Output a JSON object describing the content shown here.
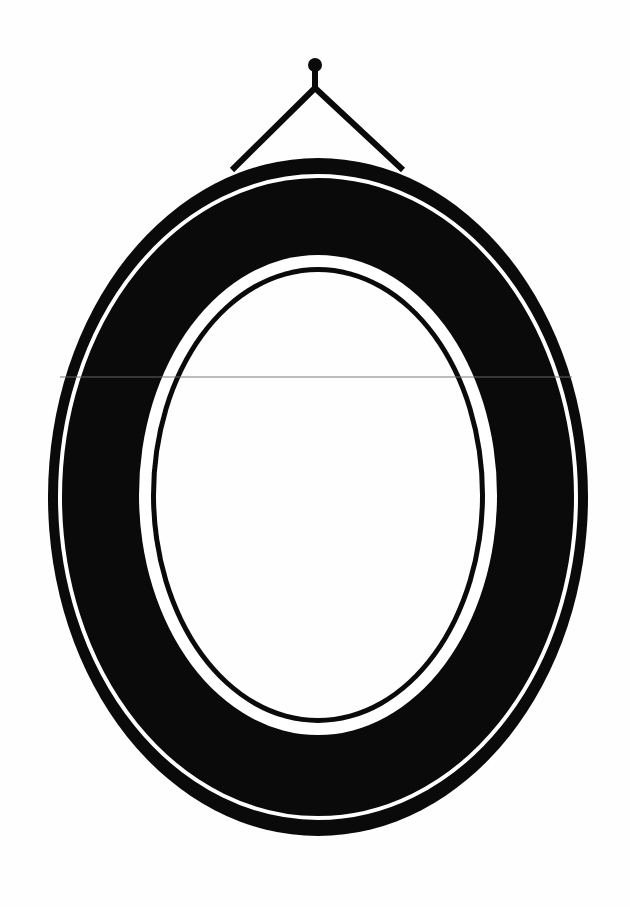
{
  "illustration": {
    "title": "Oval picture frame hanging on a nail",
    "colors": {
      "background": "#fefefe",
      "ink": "#0a0a0a",
      "scanline": "#6e6e6e"
    },
    "nail": {
      "cx": 315,
      "cy": 65,
      "r": 7,
      "stem_bottom_y": 90
    },
    "wire": {
      "apex": [
        315,
        88
      ],
      "left_end": [
        232,
        170
      ],
      "right_end": [
        403,
        170
      ],
      "stroke_width": 6
    },
    "frame": {
      "center": [
        318,
        497
      ],
      "outer": {
        "rx": 270,
        "ry": 339
      },
      "outer_white_line": {
        "rx": 258,
        "ry": 321,
        "width": 4
      },
      "inner_white_ring": {
        "rx": 179,
        "ry": 240
      },
      "inner_black_line": {
        "rx": 167,
        "ry": 228,
        "width": 5
      },
      "opening": {
        "rx": 162,
        "ry": 223
      }
    },
    "scanline": {
      "y": 377,
      "x1": 60,
      "x2": 572
    }
  }
}
